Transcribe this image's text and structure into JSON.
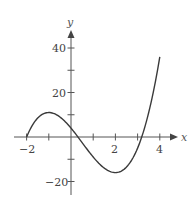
{
  "chart_data": {
    "type": "line",
    "title": "",
    "xlabel": "x",
    "ylabel": "y",
    "function": "y = 2x^3 - 3x^2 - 12x + 4",
    "xlim": [
      -2.6,
      4.9
    ],
    "ylim": [
      -25,
      48
    ],
    "x_ticks": [
      -2,
      -1,
      0,
      1,
      2,
      3,
      4
    ],
    "x_tick_labels": [
      "-2",
      "",
      "",
      "",
      "2",
      "",
      "4"
    ],
    "y_ticks": [
      -20,
      -10,
      10,
      20,
      30,
      40
    ],
    "y_tick_labels": [
      "-20",
      "",
      "",
      "20",
      "",
      "40"
    ],
    "grid": false,
    "legend": null,
    "series": [
      {
        "name": "f(x)",
        "x": [
          -2,
          -1.75,
          -1.5,
          -1.25,
          -1,
          -0.75,
          -0.5,
          -0.25,
          0,
          0.25,
          0.5,
          0.75,
          1,
          1.25,
          1.5,
          1.75,
          2,
          2.25,
          2.5,
          2.75,
          3,
          3.25,
          3.5,
          3.75,
          4
        ],
        "values": [
          0,
          5.09,
          8.5,
          10.41,
          11,
          10.47,
          9,
          6.78,
          4,
          0.84,
          -2.5,
          -5.78,
          -9,
          -11.84,
          -14,
          -15.16,
          -16,
          -15.22,
          -14,
          -11.53,
          -5,
          0.53,
          11,
          20.72,
          36
        ]
      }
    ],
    "annotations": {
      "local_max": {
        "x": -1,
        "y": 11
      },
      "local_min": {
        "x": 2,
        "y": -16
      }
    }
  },
  "labels": {
    "x_axis": "x",
    "y_axis": "y",
    "x_tick_neg2": "−2",
    "x_tick_2": "2",
    "x_tick_4": "4",
    "y_tick_40": "40",
    "y_tick_20": "20",
    "y_tick_neg20": "−20"
  }
}
